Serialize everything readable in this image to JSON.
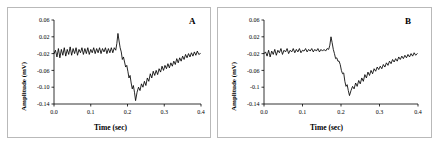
{
  "figure": {
    "background_color": "#ffffff",
    "trace_color": "#000000",
    "border_color": "#b9b9b9",
    "panels": [
      {
        "id": "A",
        "letter": "A",
        "xlabel": "Time (sec)",
        "ylabel": "Amplitude (mV)",
        "xticks": [
          "0.0",
          "0.1",
          "0.2",
          "0.3",
          "0.4"
        ],
        "yticks": [
          "0.06",
          "0.02",
          "-0.02",
          "-0.06",
          "-0.10",
          "-0.14"
        ]
      },
      {
        "id": "B",
        "letter": "B",
        "xlabel": "Time (sec)",
        "ylabel": "Amplitude (mV)",
        "xticks": [
          "0.0",
          "0.1",
          "0.2",
          "0.3",
          "0.4"
        ],
        "yticks": [
          "0.06",
          "0.02",
          "-0.02",
          "-0.06",
          "-0.1",
          "-0.14"
        ]
      }
    ]
  },
  "chart_data": [
    {
      "type": "line",
      "panel": "A",
      "title": "",
      "xlabel": "Time (sec)",
      "ylabel": "Amplitude (mV)",
      "xlim": [
        0.0,
        0.4
      ],
      "ylim": [
        -0.14,
        0.06
      ],
      "xticks": [
        0.0,
        0.1,
        0.2,
        0.3,
        0.4
      ],
      "yticks": [
        0.06,
        0.02,
        -0.02,
        -0.06,
        -0.1,
        -0.14
      ],
      "grid": false,
      "legend": null,
      "annotations": [
        "A"
      ],
      "series": [
        {
          "name": "EMG waveform A",
          "x": [
            0.0,
            0.004,
            0.008,
            0.012,
            0.016,
            0.02,
            0.024,
            0.028,
            0.032,
            0.036,
            0.04,
            0.044,
            0.048,
            0.052,
            0.056,
            0.06,
            0.064,
            0.068,
            0.072,
            0.076,
            0.08,
            0.084,
            0.088,
            0.092,
            0.096,
            0.1,
            0.104,
            0.108,
            0.112,
            0.116,
            0.12,
            0.124,
            0.128,
            0.132,
            0.136,
            0.14,
            0.144,
            0.148,
            0.152,
            0.156,
            0.16,
            0.164,
            0.168,
            0.171,
            0.174,
            0.177,
            0.18,
            0.183,
            0.186,
            0.189,
            0.192,
            0.195,
            0.198,
            0.201,
            0.204,
            0.207,
            0.21,
            0.213,
            0.216,
            0.219,
            0.222,
            0.226,
            0.23,
            0.234,
            0.238,
            0.242,
            0.246,
            0.25,
            0.254,
            0.258,
            0.262,
            0.266,
            0.27,
            0.274,
            0.278,
            0.282,
            0.286,
            0.29,
            0.294,
            0.298,
            0.302,
            0.306,
            0.31,
            0.314,
            0.318,
            0.322,
            0.326,
            0.33,
            0.334,
            0.338,
            0.342,
            0.346,
            0.35,
            0.354,
            0.358,
            0.362,
            0.366,
            0.37,
            0.374,
            0.378,
            0.382,
            0.386,
            0.39,
            0.394,
            0.398
          ],
          "y": [
            -0.02,
            -0.012,
            -0.028,
            -0.008,
            -0.03,
            -0.01,
            -0.024,
            -0.006,
            -0.026,
            -0.01,
            -0.022,
            -0.004,
            -0.024,
            -0.008,
            -0.02,
            -0.006,
            -0.024,
            -0.01,
            -0.018,
            -0.006,
            -0.022,
            -0.008,
            -0.02,
            -0.006,
            -0.022,
            -0.01,
            -0.018,
            -0.006,
            -0.02,
            -0.008,
            -0.018,
            -0.006,
            -0.02,
            -0.008,
            -0.016,
            -0.006,
            -0.02,
            -0.008,
            -0.018,
            -0.006,
            -0.018,
            -0.006,
            -0.012,
            0.004,
            0.028,
            0.01,
            -0.006,
            -0.016,
            -0.034,
            -0.028,
            -0.04,
            -0.052,
            -0.048,
            -0.062,
            -0.078,
            -0.072,
            -0.09,
            -0.104,
            -0.096,
            -0.112,
            -0.132,
            -0.112,
            -0.1,
            -0.108,
            -0.092,
            -0.1,
            -0.086,
            -0.096,
            -0.078,
            -0.086,
            -0.068,
            -0.078,
            -0.062,
            -0.072,
            -0.06,
            -0.07,
            -0.056,
            -0.064,
            -0.05,
            -0.06,
            -0.048,
            -0.056,
            -0.044,
            -0.054,
            -0.042,
            -0.05,
            -0.038,
            -0.046,
            -0.032,
            -0.042,
            -0.03,
            -0.038,
            -0.026,
            -0.034,
            -0.022,
            -0.03,
            -0.02,
            -0.028,
            -0.018,
            -0.026,
            -0.016,
            -0.024,
            -0.014,
            -0.022,
            -0.02
          ]
        }
      ]
    },
    {
      "type": "line",
      "panel": "B",
      "title": "",
      "xlabel": "Time (sec)",
      "ylabel": "Amplitude (mV)",
      "xlim": [
        0.0,
        0.4
      ],
      "ylim": [
        -0.14,
        0.06
      ],
      "xticks": [
        0.0,
        0.1,
        0.2,
        0.3,
        0.4
      ],
      "yticks": [
        0.06,
        0.02,
        -0.02,
        -0.06,
        -0.1,
        -0.14
      ],
      "grid": false,
      "legend": null,
      "annotations": [
        "B"
      ],
      "series": [
        {
          "name": "EMG waveform B",
          "x": [
            0.0,
            0.004,
            0.008,
            0.012,
            0.016,
            0.02,
            0.024,
            0.028,
            0.032,
            0.036,
            0.04,
            0.044,
            0.048,
            0.052,
            0.056,
            0.06,
            0.064,
            0.068,
            0.072,
            0.076,
            0.08,
            0.084,
            0.088,
            0.092,
            0.096,
            0.1,
            0.104,
            0.108,
            0.112,
            0.116,
            0.12,
            0.124,
            0.128,
            0.132,
            0.136,
            0.14,
            0.144,
            0.148,
            0.152,
            0.156,
            0.16,
            0.164,
            0.168,
            0.171,
            0.174,
            0.177,
            0.18,
            0.183,
            0.186,
            0.189,
            0.192,
            0.195,
            0.198,
            0.201,
            0.204,
            0.207,
            0.21,
            0.213,
            0.216,
            0.219,
            0.222,
            0.226,
            0.23,
            0.234,
            0.238,
            0.242,
            0.246,
            0.25,
            0.254,
            0.258,
            0.262,
            0.266,
            0.27,
            0.274,
            0.278,
            0.282,
            0.286,
            0.29,
            0.294,
            0.298,
            0.302,
            0.306,
            0.31,
            0.314,
            0.318,
            0.322,
            0.326,
            0.33,
            0.334,
            0.338,
            0.342,
            0.346,
            0.35,
            0.354,
            0.358,
            0.362,
            0.366,
            0.37,
            0.374,
            0.378,
            0.382,
            0.386,
            0.39,
            0.394,
            0.398
          ],
          "y": [
            -0.02,
            -0.016,
            -0.026,
            -0.012,
            -0.028,
            -0.014,
            -0.022,
            -0.01,
            -0.024,
            -0.012,
            -0.018,
            -0.008,
            -0.022,
            -0.012,
            -0.016,
            -0.008,
            -0.02,
            -0.012,
            -0.016,
            -0.008,
            -0.018,
            -0.01,
            -0.016,
            -0.008,
            -0.018,
            -0.012,
            -0.014,
            -0.008,
            -0.016,
            -0.01,
            -0.014,
            -0.008,
            -0.016,
            -0.01,
            -0.014,
            -0.008,
            -0.016,
            -0.01,
            -0.014,
            -0.01,
            -0.014,
            -0.008,
            -0.01,
            0.0,
            0.02,
            0.006,
            -0.01,
            -0.02,
            -0.032,
            -0.03,
            -0.038,
            -0.038,
            -0.046,
            -0.06,
            -0.068,
            -0.066,
            -0.086,
            -0.098,
            -0.094,
            -0.108,
            -0.12,
            -0.108,
            -0.098,
            -0.104,
            -0.09,
            -0.098,
            -0.084,
            -0.092,
            -0.078,
            -0.086,
            -0.07,
            -0.078,
            -0.064,
            -0.072,
            -0.06,
            -0.068,
            -0.056,
            -0.062,
            -0.052,
            -0.058,
            -0.05,
            -0.056,
            -0.046,
            -0.052,
            -0.042,
            -0.048,
            -0.038,
            -0.044,
            -0.034,
            -0.04,
            -0.032,
            -0.038,
            -0.028,
            -0.034,
            -0.026,
            -0.032,
            -0.024,
            -0.03,
            -0.022,
            -0.028,
            -0.02,
            -0.026,
            -0.018,
            -0.024,
            -0.02
          ]
        }
      ]
    }
  ]
}
